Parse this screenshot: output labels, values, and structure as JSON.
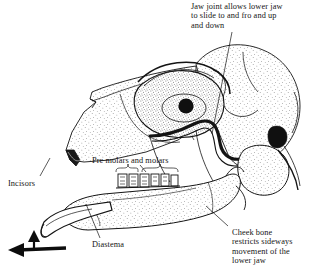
{
  "figure": {
    "background_color": "#ffffff",
    "ink_color": "#141414"
  },
  "labels": {
    "jaw_joint": "Jaw joint allows lower jaw\nto slide to and fro and up\nand down",
    "cheek_bone": "Cheek bone\nrestricts sideways\nmovement of the\nlower jaw",
    "pre_molars": "Pre molars and molars",
    "incisors": "Incisors",
    "diastema": "Diastema"
  },
  "icons": {
    "movement_arrow": "jaw-movement-arrow"
  }
}
